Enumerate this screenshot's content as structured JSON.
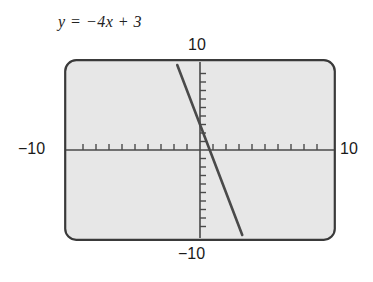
{
  "equation": {
    "text": "y = −4x + 3",
    "slope": -4,
    "intercept": 3
  },
  "labels": {
    "top": "10",
    "left": "−10",
    "right": "10",
    "bottom": "−10"
  },
  "colors": {
    "screen_fill": "#e7e7e7",
    "screen_border": "#3a3a3a",
    "axis": "#4a4a4a",
    "curve": "#4a4a4a",
    "text": "#1a1a1a"
  },
  "chart_data": {
    "type": "line",
    "title": "",
    "subtitle": "",
    "xlabel": "",
    "ylabel": "",
    "equation": "y = -4x + 3",
    "slope": -4,
    "y_intercept": 3,
    "x_intercept": 0.75,
    "xlim": [
      -10,
      10
    ],
    "ylim": [
      -10,
      10
    ],
    "xtick_step": 1,
    "ytick_step": 1,
    "grid": false,
    "legend": "none",
    "annotations": [
      "10",
      "-10",
      "10",
      "-10"
    ],
    "series": [
      {
        "name": "y = -4x + 3",
        "x": [
          -1.75,
          3.25
        ],
        "values": [
          10,
          -10
        ]
      }
    ]
  }
}
